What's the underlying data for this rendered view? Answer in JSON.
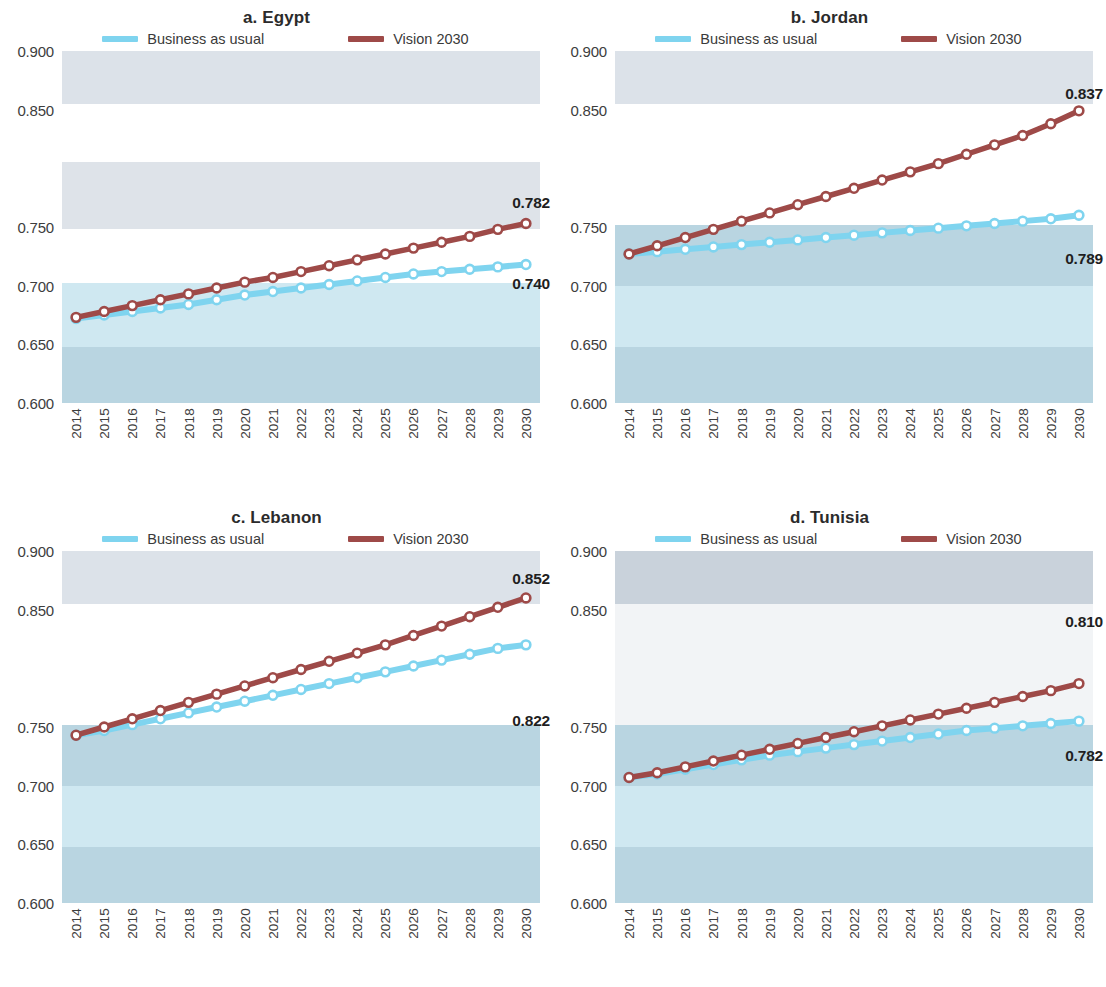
{
  "legend": {
    "bau": {
      "label": "Business as usual",
      "color": "#7fd4ef"
    },
    "vision": {
      "label": "Vision 2030",
      "color": "#9e4a48"
    }
  },
  "axis": {
    "y_ticks": [
      "0.900",
      "0.850",
      "0.750",
      "0.700",
      "0.650",
      "0.600"
    ],
    "y_tick_values": [
      0.9,
      0.85,
      0.75,
      0.7,
      0.65,
      0.6
    ],
    "ymin": 0.6,
    "ymax": 0.9,
    "years": [
      "2014",
      "2015",
      "2016",
      "2017",
      "2018",
      "2019",
      "2020",
      "2021",
      "2022",
      "2023",
      "2024",
      "2025",
      "2026",
      "2027",
      "2028",
      "2029",
      "2030"
    ]
  },
  "panels": [
    {
      "title": "a. Egypt",
      "end_label_vision": "0.782",
      "end_label_bau": "0.740"
    },
    {
      "title": "b. Jordan",
      "end_label_vision": "0.837",
      "end_label_bau": "0.789"
    },
    {
      "title": "c. Lebanon",
      "end_label_vision": "0.852",
      "end_label_bau": "0.822"
    },
    {
      "title": "d. Tunisia",
      "end_label_vision": "0.810",
      "end_label_bau": "0.782"
    }
  ],
  "chart_data": {
    "type": "line",
    "title": "",
    "xlabel": "",
    "ylabel": "",
    "ylim": [
      0.6,
      0.9
    ],
    "grid": false,
    "legend_position": "top-center",
    "x": [
      2014,
      2015,
      2016,
      2017,
      2018,
      2019,
      2020,
      2021,
      2022,
      2023,
      2024,
      2025,
      2026,
      2027,
      2028,
      2029,
      2030
    ],
    "panels": [
      {
        "name": "a. Egypt",
        "series": [
          {
            "name": "Business as usual",
            "color": "#7fd4ef",
            "values": [
              0.672,
              0.675,
              0.678,
              0.681,
              0.684,
              0.688,
              0.692,
              0.695,
              0.698,
              0.701,
              0.704,
              0.707,
              0.71,
              0.712,
              0.714,
              0.716,
              0.718
            ],
            "end_annotation": "0.740"
          },
          {
            "name": "Vision 2030",
            "color": "#9e4a48",
            "values": [
              0.673,
              0.678,
              0.683,
              0.688,
              0.693,
              0.698,
              0.703,
              0.707,
              0.712,
              0.717,
              0.722,
              0.727,
              0.732,
              0.737,
              0.742,
              0.748,
              0.753
            ],
            "end_annotation": "0.782"
          }
        ]
      },
      {
        "name": "b. Jordan",
        "series": [
          {
            "name": "Business as usual",
            "color": "#7fd4ef",
            "values": [
              0.727,
              0.729,
              0.731,
              0.733,
              0.735,
              0.737,
              0.739,
              0.741,
              0.743,
              0.745,
              0.747,
              0.749,
              0.751,
              0.753,
              0.755,
              0.757,
              0.76
            ],
            "end_annotation": "0.789"
          },
          {
            "name": "Vision 2030",
            "color": "#9e4a48",
            "values": [
              0.727,
              0.734,
              0.741,
              0.748,
              0.755,
              0.762,
              0.769,
              0.776,
              0.783,
              0.79,
              0.797,
              0.804,
              0.812,
              0.82,
              0.828,
              0.838,
              0.849
            ],
            "end_annotation": "0.837"
          }
        ]
      },
      {
        "name": "c. Lebanon",
        "series": [
          {
            "name": "Business as usual",
            "color": "#7fd4ef",
            "values": [
              0.743,
              0.747,
              0.752,
              0.757,
              0.762,
              0.767,
              0.772,
              0.777,
              0.782,
              0.787,
              0.792,
              0.797,
              0.802,
              0.807,
              0.812,
              0.817,
              0.82
            ],
            "end_annotation": "0.822"
          },
          {
            "name": "Vision 2030",
            "color": "#9e4a48",
            "values": [
              0.743,
              0.75,
              0.757,
              0.764,
              0.771,
              0.778,
              0.785,
              0.792,
              0.799,
              0.806,
              0.813,
              0.82,
              0.828,
              0.836,
              0.844,
              0.852,
              0.86
            ],
            "end_annotation": "0.852"
          }
        ]
      },
      {
        "name": "d. Tunisia",
        "series": [
          {
            "name": "Business as usual",
            "color": "#7fd4ef",
            "values": [
              0.707,
              0.71,
              0.714,
              0.718,
              0.722,
              0.726,
              0.729,
              0.732,
              0.735,
              0.738,
              0.741,
              0.744,
              0.747,
              0.749,
              0.751,
              0.753,
              0.755
            ],
            "end_annotation": "0.782"
          },
          {
            "name": "Vision 2030",
            "color": "#9e4a48",
            "values": [
              0.707,
              0.711,
              0.716,
              0.721,
              0.726,
              0.731,
              0.736,
              0.741,
              0.746,
              0.751,
              0.756,
              0.761,
              0.766,
              0.771,
              0.776,
              0.781,
              0.787
            ],
            "end_annotation": "0.810"
          }
        ]
      }
    ]
  },
  "bands": {
    "note": "alternating horizontal background bands",
    "colors": [
      "#dde3ea",
      "#ffffff",
      "#dfe4e9",
      "#ffffff",
      "#cfe9f2",
      "#b9d6e2"
    ]
  }
}
